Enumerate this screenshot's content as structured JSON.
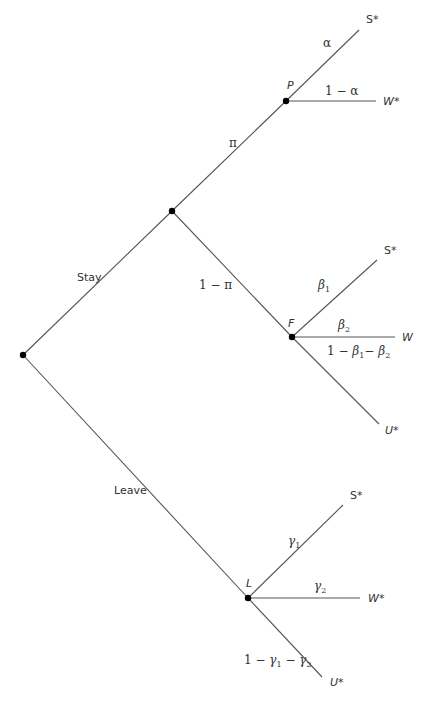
{
  "diagram": {
    "type": "probability-tree",
    "nodes": {
      "root": {
        "x": 23,
        "y": 355
      },
      "stay": {
        "x": 172,
        "y": 211
      },
      "P": {
        "x": 286,
        "y": 101,
        "label": "P"
      },
      "F": {
        "x": 292,
        "y": 337,
        "label": "F"
      },
      "L": {
        "x": 248,
        "y": 598,
        "label": "L"
      }
    },
    "branches": {
      "stay": {
        "label": "Stay"
      },
      "leave": {
        "label": "Leave"
      },
      "pi": {
        "label": "π"
      },
      "one_minus_pi": {
        "label": "1 − π"
      },
      "alpha": {
        "label": "α"
      },
      "one_minus_alpha": {
        "label": "1 − α"
      },
      "beta1": {
        "sym": "β",
        "sub": "1"
      },
      "beta2": {
        "sym": "β",
        "sub": "2"
      },
      "one_minus_betas": {
        "prefix": "1 − ",
        "sym1": "β",
        "sub1": "1",
        "mid": "− ",
        "sym2": "β",
        "sub2": "2"
      },
      "gamma1": {
        "sym": "γ",
        "sub": "1"
      },
      "gamma2": {
        "sym": "γ",
        "sub": "2"
      },
      "one_minus_gammas": {
        "prefix": "1 − ",
        "sym1": "γ",
        "sub1": "1",
        "mid": " − ",
        "sym2": "γ",
        "sub2": "2"
      }
    },
    "outcomes": {
      "P_S": "S*",
      "P_W": "W*",
      "F_S": "S*",
      "F_W": "W",
      "F_U": "U*",
      "L_S": "S*",
      "L_W": "W*",
      "L_U": "U*"
    },
    "colors": {
      "line": "#555555",
      "node": "#000000",
      "text": "#333333"
    }
  }
}
